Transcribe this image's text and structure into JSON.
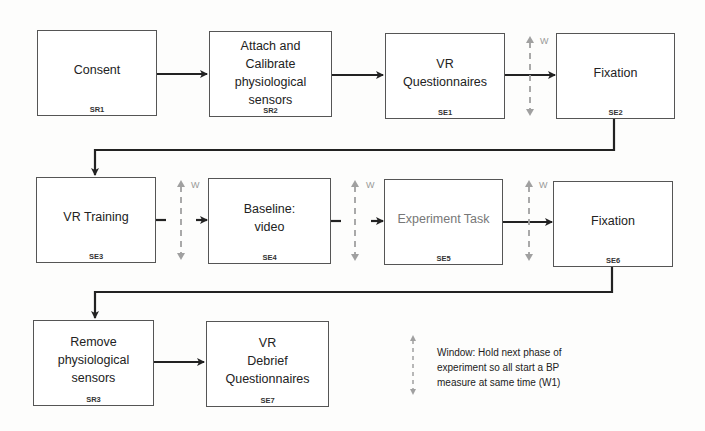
{
  "diagram": {
    "type": "flowchart",
    "rows": [
      {
        "nodes": [
          {
            "id": "SR1",
            "label": "Consent",
            "code": "SR1"
          },
          {
            "id": "SR2",
            "label": "Attach and\nCalibrate\nphysiological\nsensors",
            "code": "SR2"
          },
          {
            "id": "SE1",
            "label": "VR\nQuestionnaires",
            "code": "SE1"
          },
          {
            "id": "SE2",
            "label": "Fixation",
            "code": "SE2"
          }
        ]
      },
      {
        "nodes": [
          {
            "id": "SE3",
            "label": "VR Training",
            "code": "SE3"
          },
          {
            "id": "SE4",
            "label": "Baseline:\nvideo",
            "code": "SE4"
          },
          {
            "id": "SE5",
            "label": "Experiment Task",
            "code": "SE5"
          },
          {
            "id": "SE6",
            "label": "Fixation",
            "code": "SE6"
          }
        ]
      },
      {
        "nodes": [
          {
            "id": "SR3",
            "label": "Remove\nphysiological\nsensors",
            "code": "SR3"
          },
          {
            "id": "SE7",
            "label": "VR\nDebrief\nQuestionnaires",
            "code": "SE7"
          }
        ]
      }
    ],
    "edges": [
      {
        "from": "SR1",
        "to": "SR2"
      },
      {
        "from": "SR2",
        "to": "SE1"
      },
      {
        "from": "SE1",
        "to": "SE2",
        "window": true
      },
      {
        "from": "SE2",
        "to": "SE3"
      },
      {
        "from": "SE3",
        "to": "SE4",
        "window": true,
        "broken": true
      },
      {
        "from": "SE4",
        "to": "SE5",
        "window": true,
        "broken": true
      },
      {
        "from": "SE5",
        "to": "SE6",
        "window": true
      },
      {
        "from": "SE6",
        "to": "SR3"
      },
      {
        "from": "SR3",
        "to": "SE7"
      }
    ],
    "window_marker": "W",
    "legend": {
      "text": "Window: Hold next phase of\nexperiment so all start a BP\nmeasure at same time (W1)"
    },
    "colors": {
      "box_border": "#555555",
      "arrow": "#222222",
      "window_arrow": "#9a9a9a",
      "muted_text": "#777777"
    }
  }
}
